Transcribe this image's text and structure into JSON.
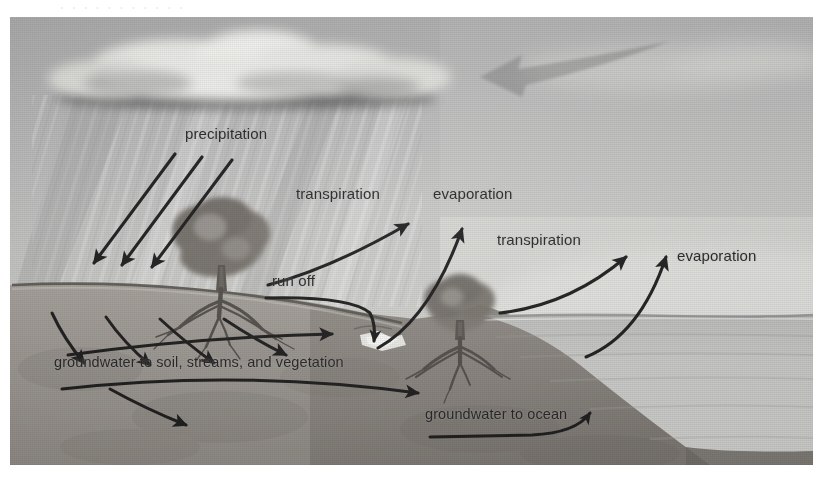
{
  "figure": {
    "type": "illustration",
    "scan_bleed_text": "·  ·      ·   ·  ·    ·        ·    ·   ·     ·    ·",
    "labels": {
      "precipitation": "precipitation",
      "transpiration_left": "transpiration",
      "evaporation_left": "evaporation",
      "transpiration_right": "transpiration",
      "evaporation_right": "evaporation",
      "run_off": "run off",
      "groundwater_soil": "groundwater to soil, streams, and vegetation",
      "groundwater_ocean": "groundwater to ocean"
    },
    "elements": {
      "cloud": "rain-cloud",
      "rain": "rain-streaks",
      "tree_left": "tree-with-roots",
      "tree_right": "tree-with-roots",
      "ocean": "ocean",
      "horizon": "horizon-line",
      "hill": "hillside",
      "waterfall": "run-off-waterfall",
      "big_arrow": "large-gray-arrow-pointing-left"
    },
    "colors": {
      "sky": "#b4b4b4",
      "ground": "#a09b94",
      "ground_dark": "#8d8881",
      "ocean": "#c3c3c1",
      "cloud_light": "#f2f2f0",
      "cloud_dark": "#6e6e6e",
      "ink": "#1d1d1d",
      "page": "#ffffff"
    }
  }
}
